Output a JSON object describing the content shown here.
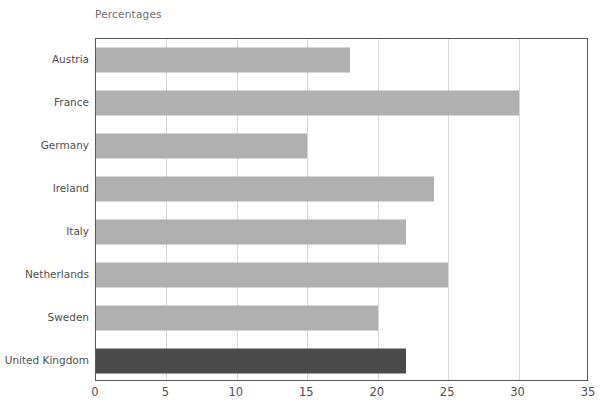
{
  "chart_data": {
    "type": "bar",
    "orientation": "horizontal",
    "title": "Percentages",
    "xlabel": "",
    "ylabel": "",
    "xlim": [
      0,
      35
    ],
    "xticks": [
      0,
      5,
      10,
      15,
      20,
      25,
      30,
      35
    ],
    "grid": "vertical",
    "legend": "none",
    "categories": [
      "Austria",
      "France",
      "Germany",
      "Ireland",
      "Italy",
      "Netherlands",
      "Sweden",
      "United Kingdom"
    ],
    "values": [
      18,
      30,
      15,
      24,
      22,
      25,
      20,
      22
    ],
    "bar_colors": [
      "#b0b0b0",
      "#b0b0b0",
      "#b0b0b0",
      "#b0b0b0",
      "#b0b0b0",
      "#b0b0b0",
      "#b0b0b0",
      "#4a4a4a"
    ],
    "highlight_category": "United Kingdom",
    "colors": {
      "bar_default": "#b0b0b0",
      "bar_highlight": "#4a4a4a",
      "gridline": "#d7d7d7",
      "axis_frame": "#58585a",
      "label_text": "#4f4f4f",
      "title_text": "#6d6d6d",
      "background": "#ffffff"
    }
  }
}
